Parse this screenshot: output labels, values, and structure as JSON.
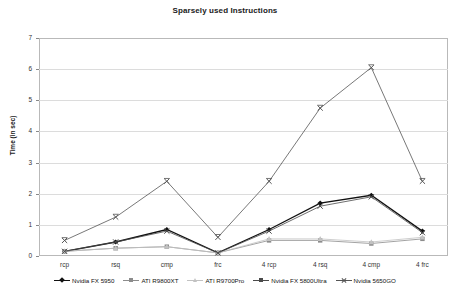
{
  "chart_data": {
    "type": "line",
    "title": "Sparsely used Instructions",
    "xlabel": "",
    "ylabel": "Time (in sec)",
    "categories": [
      "rcp",
      "rsq",
      "cmp",
      "frc",
      "4 rcp",
      "4 rsq",
      "4 cmp",
      "4 frc"
    ],
    "ylim": [
      0,
      7
    ],
    "yticks": [
      "0",
      "1",
      "2",
      "3",
      "4",
      "5",
      "6",
      "7"
    ],
    "grid": true,
    "legend_position": "bottom",
    "series": [
      {
        "name": "Nvidia FX 5950",
        "color": "#111111",
        "marker": "diamond",
        "values": [
          0.15,
          0.45,
          0.85,
          0.1,
          0.85,
          1.7,
          1.95,
          0.8
        ]
      },
      {
        "name": "ATI R9800XT",
        "color": "#8c8c8c",
        "marker": "square",
        "values": [
          0.15,
          0.25,
          0.3,
          0.1,
          0.5,
          0.5,
          0.4,
          0.55
        ]
      },
      {
        "name": "ATI R9700Pro",
        "color": "#c2c2c2",
        "marker": "triangle",
        "values": [
          0.15,
          0.25,
          0.3,
          0.1,
          0.55,
          0.55,
          0.45,
          0.6
        ]
      },
      {
        "name": "Nvidia FX 5800Ultra",
        "color": "#4a4a4a",
        "marker": "cross",
        "values": [
          0.15,
          0.45,
          0.8,
          0.1,
          0.8,
          1.6,
          1.9,
          0.75
        ]
      },
      {
        "name": "Nvidia 5650GO",
        "color": "#555555",
        "marker": "x",
        "values": [
          0.5,
          1.25,
          2.4,
          0.6,
          2.4,
          4.75,
          6.05,
          2.4
        ]
      }
    ]
  }
}
